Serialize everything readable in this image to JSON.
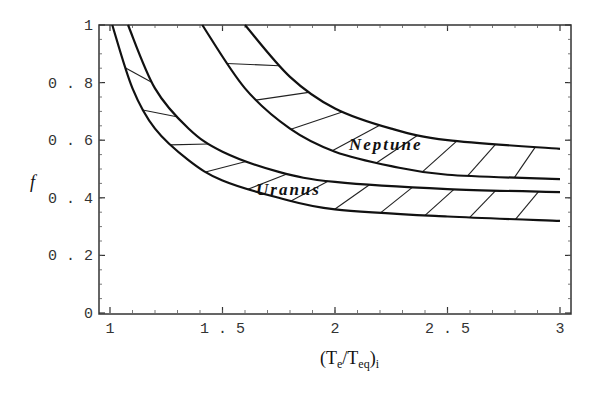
{
  "chart_data": {
    "type": "line",
    "title": "",
    "xlabel": "(Te/Teq)i",
    "ylabel": "f",
    "xlim": [
      0.97,
      3.03
    ],
    "ylim": [
      0,
      1
    ],
    "x_ticks": [
      "1",
      "1.5",
      "2",
      "2.5",
      "3"
    ],
    "y_ticks": [
      "0",
      "0.2",
      "0.4",
      "0.6",
      "0.8",
      "1"
    ],
    "grid": false,
    "legend": null,
    "annotations": [
      "Neptune",
      "Uranus"
    ],
    "series": [
      {
        "name": "Uranus lower bound",
        "x": [
          1.01,
          1.1,
          1.2,
          1.35,
          1.5,
          1.75,
          2.0,
          2.5,
          3.0
        ],
        "values": [
          1.0,
          0.78,
          0.64,
          0.53,
          0.46,
          0.4,
          0.36,
          0.335,
          0.32
        ]
      },
      {
        "name": "Uranus upper bound",
        "x": [
          1.08,
          1.2,
          1.35,
          1.5,
          1.75,
          2.0,
          2.5,
          3.0
        ],
        "values": [
          1.0,
          0.78,
          0.64,
          0.56,
          0.49,
          0.455,
          0.43,
          0.42
        ]
      },
      {
        "name": "Neptune lower bound",
        "x": [
          1.41,
          1.6,
          1.8,
          2.0,
          2.25,
          2.5,
          3.0
        ],
        "values": [
          1.0,
          0.78,
          0.64,
          0.56,
          0.51,
          0.48,
          0.465
        ]
      },
      {
        "name": "Neptune upper bound",
        "x": [
          1.6,
          1.8,
          2.0,
          2.25,
          2.5,
          3.0
        ],
        "values": [
          1.0,
          0.82,
          0.71,
          0.64,
          0.6,
          0.57
        ]
      }
    ]
  },
  "labels": {
    "ylabel": "f",
    "xlabel_main": "(T",
    "xlabel_sub1": "e",
    "xlabel_mid": "/T",
    "xlabel_sub2": "eq",
    "xlabel_end": ")",
    "xlabel_sub3": "i",
    "neptune": "Neptune",
    "uranus": "Uranus"
  }
}
